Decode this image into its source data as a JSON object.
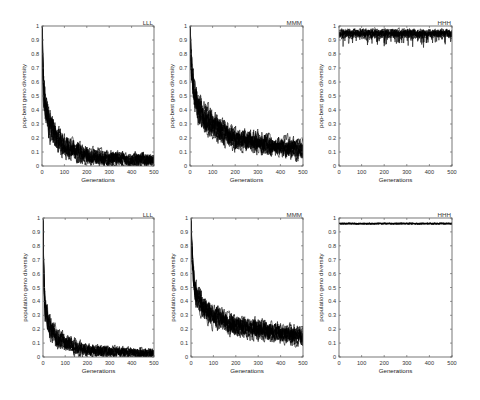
{
  "figure": {
    "background": "#ffffff",
    "line_color": "#000000",
    "runs_per_panel": 10
  },
  "chart_data": [
    {
      "type": "line",
      "title": "LLL",
      "xlabel": "Generations",
      "ylabel": "pop-best geno diversity",
      "xlim": [
        0,
        500
      ],
      "ylim": [
        0,
        1
      ],
      "xticklabels": [
        "0",
        "100",
        "200",
        "300",
        "400",
        "500"
      ],
      "yticklabels": [
        "0",
        "0.1",
        "0.2",
        "0.3",
        "0.4",
        "0.5",
        "0.6",
        "0.7",
        "0.8",
        "0.9",
        "1"
      ],
      "grid": false,
      "series": [
        {
          "name": "approx. mean of overlaid runs",
          "x": [
            0,
            5,
            15,
            30,
            60,
            100,
            150,
            200,
            300,
            400,
            500
          ],
          "values": [
            1.0,
            0.6,
            0.42,
            0.3,
            0.2,
            0.14,
            0.1,
            0.07,
            0.05,
            0.04,
            0.04
          ]
        }
      ],
      "band_halfwidth": {
        "early": 0.09,
        "late": 0.035
      },
      "dips": false
    },
    {
      "type": "line",
      "title": "MMM",
      "xlabel": "Generations",
      "ylabel": "pop-best geno diversity",
      "xlim": [
        0,
        500
      ],
      "ylim": [
        0,
        1
      ],
      "xticklabels": [
        "0",
        "100",
        "200",
        "300",
        "400",
        "500"
      ],
      "yticklabels": [
        "0",
        "0.1",
        "0.2",
        "0.3",
        "0.4",
        "0.5",
        "0.6",
        "0.7",
        "0.8",
        "0.9",
        "1"
      ],
      "grid": false,
      "series": [
        {
          "name": "approx. mean of overlaid runs",
          "x": [
            0,
            5,
            15,
            30,
            60,
            100,
            150,
            200,
            300,
            400,
            500
          ],
          "values": [
            1.0,
            0.75,
            0.55,
            0.45,
            0.37,
            0.3,
            0.24,
            0.2,
            0.17,
            0.14,
            0.12
          ]
        }
      ],
      "band_halfwidth": {
        "early": 0.09,
        "late": 0.05
      },
      "dips": false
    },
    {
      "type": "line",
      "title": "HHH",
      "xlabel": "Generations",
      "ylabel": "pop-best geno diversity",
      "xlim": [
        0,
        500
      ],
      "ylim": [
        0,
        1
      ],
      "xticklabels": [
        "0",
        "100",
        "200",
        "300",
        "400",
        "500"
      ],
      "yticklabels": [
        "0",
        "0.1",
        "0.2",
        "0.3",
        "0.4",
        "0.5",
        "0.6",
        "0.7",
        "0.8",
        "0.9",
        "1"
      ],
      "grid": false,
      "series": [
        {
          "name": "approx. mean of overlaid runs",
          "x": [
            0,
            100,
            200,
            300,
            400,
            500
          ],
          "values": [
            0.945,
            0.945,
            0.945,
            0.945,
            0.945,
            0.945
          ]
        }
      ],
      "band_halfwidth": {
        "early": 0.022,
        "late": 0.022
      },
      "dips": true
    },
    {
      "type": "line",
      "title": "LLL",
      "xlabel": "Generations",
      "ylabel": "population geno diversity",
      "xlim": [
        0,
        500
      ],
      "ylim": [
        0,
        1
      ],
      "xticklabels": [
        "0",
        "100",
        "200",
        "300",
        "400",
        "500"
      ],
      "yticklabels": [
        "0",
        "0.1",
        "0.2",
        "0.3",
        "0.4",
        "0.5",
        "0.6",
        "0.7",
        "0.8",
        "0.9",
        "1"
      ],
      "grid": false,
      "series": [
        {
          "name": "approx. mean of overlaid runs",
          "x": [
            0,
            3,
            10,
            30,
            60,
            100,
            150,
            200,
            300,
            400,
            500
          ],
          "values": [
            1.0,
            0.6,
            0.35,
            0.22,
            0.14,
            0.1,
            0.07,
            0.05,
            0.035,
            0.03,
            0.025
          ]
        }
      ],
      "band_halfwidth": {
        "early": 0.07,
        "late": 0.025
      },
      "dips": false
    },
    {
      "type": "line",
      "title": "MMM",
      "xlabel": "Generations",
      "ylabel": "population geno diversity",
      "xlim": [
        0,
        500
      ],
      "ylim": [
        0,
        1
      ],
      "xticklabels": [
        "0",
        "100",
        "200",
        "300",
        "400",
        "500"
      ],
      "yticklabels": [
        "0",
        "0.1",
        "0.2",
        "0.3",
        "0.4",
        "0.5",
        "0.6",
        "0.7",
        "0.8",
        "0.9",
        "1"
      ],
      "grid": false,
      "series": [
        {
          "name": "approx. mean of overlaid runs",
          "x": [
            0,
            5,
            15,
            30,
            60,
            100,
            150,
            200,
            300,
            400,
            500
          ],
          "values": [
            1.0,
            0.7,
            0.5,
            0.42,
            0.35,
            0.3,
            0.26,
            0.22,
            0.2,
            0.17,
            0.15
          ]
        }
      ],
      "band_halfwidth": {
        "early": 0.07,
        "late": 0.05
      },
      "dips": false
    },
    {
      "type": "line",
      "title": "HHH",
      "xlabel": "Generations",
      "ylabel": "population geno diversity",
      "xlim": [
        0,
        500
      ],
      "ylim": [
        0,
        1
      ],
      "xticklabels": [
        "0",
        "100",
        "200",
        "300",
        "400",
        "500"
      ],
      "yticklabels": [
        "0",
        "0.1",
        "0.2",
        "0.3",
        "0.4",
        "0.5",
        "0.6",
        "0.7",
        "0.8",
        "0.9",
        "1"
      ],
      "grid": false,
      "series": [
        {
          "name": "approx. mean of overlaid runs",
          "x": [
            0,
            100,
            200,
            300,
            400,
            500
          ],
          "values": [
            0.96,
            0.96,
            0.96,
            0.96,
            0.96,
            0.96
          ]
        }
      ],
      "band_halfwidth": {
        "early": 0.004,
        "late": 0.004
      },
      "dips": false
    }
  ]
}
